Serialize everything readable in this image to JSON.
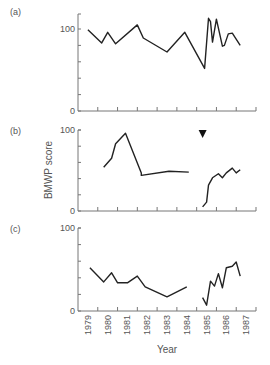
{
  "chart_data": {
    "type": "line",
    "title": "",
    "ylabel": "BMWP score",
    "xlabel": "Year",
    "x_tick_labels": [
      "1979",
      "1980",
      "1981",
      "1982",
      "1983",
      "1984",
      "1985",
      "1986",
      "1987"
    ],
    "xlim": [
      1979,
      1988
    ],
    "ylim": [
      0,
      100
    ],
    "grid": false,
    "legend": "none",
    "annotation": {
      "type": "triangle-down marker",
      "panel": "b",
      "x": 1985.3,
      "description": "event marker above panel (b)"
    },
    "panels": [
      {
        "label": "(a)",
        "y_ticks": [
          "0",
          "100"
        ],
        "y_max_axis": 118,
        "segments": [
          [
            [
              1979.5,
              99
            ],
            [
              1980.2,
              83
            ],
            [
              1980.5,
              96
            ],
            [
              1980.9,
              82
            ],
            [
              1982.0,
              105
            ],
            [
              1982.3,
              89
            ],
            [
              1983.5,
              72
            ],
            [
              1984.4,
              96
            ],
            [
              1985.4,
              52
            ],
            [
              1985.6,
              113
            ],
            [
              1985.7,
              109
            ],
            [
              1985.8,
              84
            ],
            [
              1986.0,
              112
            ],
            [
              1986.3,
              79
            ],
            [
              1986.4,
              80
            ],
            [
              1986.6,
              94
            ],
            [
              1986.8,
              95
            ],
            [
              1987.2,
              80
            ]
          ]
        ]
      },
      {
        "label": "(b)",
        "y_ticks": [
          "0",
          "100"
        ],
        "y_max_axis": 100,
        "segments": [
          [
            [
              1980.3,
              54
            ],
            [
              1980.7,
              65
            ],
            [
              1980.9,
              83
            ],
            [
              1981.4,
              96
            ],
            [
              1982.2,
              47
            ],
            [
              1982.2,
              44
            ],
            [
              1983.6,
              49
            ],
            [
              1984.6,
              48
            ]
          ],
          [
            [
              1985.3,
              5
            ],
            [
              1985.5,
              11
            ],
            [
              1985.6,
              32
            ],
            [
              1985.8,
              41
            ],
            [
              1986.1,
              46
            ],
            [
              1986.3,
              41
            ],
            [
              1986.5,
              47
            ],
            [
              1986.8,
              53
            ],
            [
              1987.0,
              47
            ],
            [
              1987.2,
              51
            ]
          ]
        ]
      },
      {
        "label": "(c)",
        "y_ticks": [
          "0",
          "100"
        ],
        "y_max_axis": 100,
        "segments": [
          [
            [
              1979.6,
              52
            ],
            [
              1980.3,
              35
            ],
            [
              1980.7,
              46
            ],
            [
              1981.0,
              34
            ],
            [
              1981.5,
              34
            ],
            [
              1982.0,
              42
            ],
            [
              1982.4,
              29
            ],
            [
              1983.5,
              17
            ],
            [
              1984.5,
              29
            ]
          ],
          [
            [
              1985.3,
              16
            ],
            [
              1985.5,
              7
            ],
            [
              1985.7,
              36
            ],
            [
              1985.9,
              30
            ],
            [
              1986.1,
              45
            ],
            [
              1986.3,
              28
            ],
            [
              1986.5,
              52
            ],
            [
              1986.8,
              54
            ],
            [
              1987.0,
              59
            ],
            [
              1987.2,
              42
            ]
          ]
        ]
      }
    ]
  },
  "layout": {
    "axis_x0": 78,
    "axis_x1": 256,
    "panels_px": [
      {
        "zero_y": 111,
        "hundred_y": 29,
        "top_y": 14
      },
      {
        "zero_y": 211,
        "hundred_y": 130,
        "top_y": 130
      },
      {
        "zero_y": 311,
        "hundred_y": 228,
        "top_y": 228
      }
    ],
    "line_color": "#222222",
    "axis_color": "#777777"
  }
}
